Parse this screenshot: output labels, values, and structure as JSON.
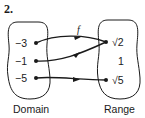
{
  "problem_number": "2.",
  "function_label": "f",
  "domain": {
    "label": "Domain",
    "values": [
      "−3",
      "−1",
      "−5"
    ]
  },
  "range": {
    "label": "Range",
    "values": [
      "√2",
      "1",
      "√5"
    ]
  },
  "mappings": [
    {
      "from": "−3",
      "to": "√2"
    },
    {
      "from": "−1",
      "to": "√2"
    },
    {
      "from": "−5",
      "to": "√5"
    }
  ]
}
